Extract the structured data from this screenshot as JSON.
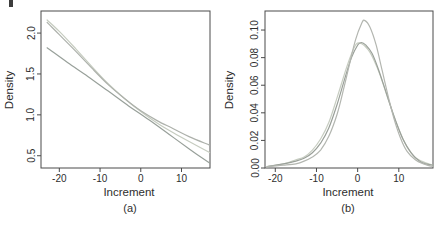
{
  "figure": {
    "ylabel": "Density",
    "xlabel": "Increment",
    "panel_captions": [
      "(a)",
      "(b)"
    ]
  },
  "chart_data": [
    {
      "type": "line",
      "panel": "a",
      "caption": "(a)",
      "title": "",
      "xlabel": "Increment",
      "ylabel": "Density",
      "grid": false,
      "legend": null,
      "xlim": [
        -24.5,
        17
      ],
      "ylim": [
        0.35,
        2.27
      ],
      "xticks": {
        "values": [
          -20,
          -10,
          0,
          10
        ],
        "labels": [
          "-20",
          "-10",
          "0",
          "10"
        ]
      },
      "yticks": {
        "values": [
          0.5,
          1.0,
          1.5,
          2.0
        ],
        "labels": [
          "0.5",
          "1.0",
          "1.5",
          "2.0"
        ]
      },
      "series": [
        {
          "name": "curve-light",
          "color": "#c6ccc0",
          "points": [
            [
              -23,
              2.16
            ],
            [
              -20,
              2.02
            ],
            [
              -16,
              1.81
            ],
            [
              -12,
              1.59
            ],
            [
              -8,
              1.38
            ],
            [
              -4,
              1.2
            ],
            [
              0,
              1.04
            ],
            [
              4,
              0.9
            ],
            [
              8,
              0.78
            ],
            [
              12,
              0.67
            ],
            [
              16.9,
              0.54
            ]
          ]
        },
        {
          "name": "curve-gray",
          "color": "#adb1ab",
          "points": [
            [
              -23,
              2.13
            ],
            [
              -20,
              1.98
            ],
            [
              -16,
              1.78
            ],
            [
              -12,
              1.57
            ],
            [
              -8,
              1.37
            ],
            [
              -4,
              1.2
            ],
            [
              0,
              1.05
            ],
            [
              4,
              0.93
            ],
            [
              8,
              0.83
            ],
            [
              12,
              0.73
            ],
            [
              16.9,
              0.63
            ]
          ]
        },
        {
          "name": "straight-line",
          "color": "#98a09a",
          "points": [
            [
              -23,
              1.82
            ],
            [
              -18,
              1.64
            ],
            [
              -13,
              1.47
            ],
            [
              -8,
              1.29
            ],
            [
              -3,
              1.11
            ],
            [
              2,
              0.94
            ],
            [
              7,
              0.76
            ],
            [
              12,
              0.58
            ],
            [
              16.9,
              0.41
            ]
          ]
        }
      ]
    },
    {
      "type": "line",
      "panel": "b",
      "caption": "(b)",
      "title": "",
      "xlabel": "Increment",
      "ylabel": "Density",
      "grid": false,
      "legend": null,
      "xlim": [
        -22.5,
        18.3
      ],
      "ylim": [
        0,
        0.1138
      ],
      "xticks": {
        "values": [
          -20,
          -10,
          0,
          10
        ],
        "labels": [
          "-20",
          "-10",
          "0",
          "10"
        ]
      },
      "yticks": {
        "values": [
          0.0,
          0.02,
          0.04,
          0.06,
          0.08,
          0.1
        ],
        "labels": [
          "0.00",
          "0.02",
          "0.04",
          "0.06",
          "0.08",
          "0.10"
        ]
      },
      "series": [
        {
          "name": "broad-curve-light",
          "color": "#c7cdc1",
          "points": [
            [
              -22,
              0.001
            ],
            [
              -18,
              0.003
            ],
            [
              -15,
              0.006
            ],
            [
              -13,
              0.008
            ],
            [
              -11,
              0.013
            ],
            [
              -9,
              0.021
            ],
            [
              -7,
              0.033
            ],
            [
              -5,
              0.051
            ],
            [
              -3,
              0.07
            ],
            [
              -1.6,
              0.082
            ],
            [
              -0.3,
              0.09
            ],
            [
              1,
              0.09
            ],
            [
              2.5,
              0.086
            ],
            [
              4,
              0.078
            ],
            [
              5.5,
              0.067
            ],
            [
              7.5,
              0.049
            ],
            [
              9.5,
              0.032
            ],
            [
              11.5,
              0.018
            ],
            [
              13.5,
              0.009
            ],
            [
              15.5,
              0.005
            ],
            [
              18.3,
              0.002
            ]
          ]
        },
        {
          "name": "broad-curve-dark",
          "color": "#9aa099",
          "points": [
            [
              -22,
              0.001
            ],
            [
              -18,
              0.003
            ],
            [
              -15,
              0.005
            ],
            [
              -13,
              0.007
            ],
            [
              -11,
              0.011
            ],
            [
              -9,
              0.018
            ],
            [
              -7,
              0.029
            ],
            [
              -5,
              0.046
            ],
            [
              -3,
              0.066
            ],
            [
              -1.5,
              0.08
            ],
            [
              0,
              0.089
            ],
            [
              0.9,
              0.091
            ],
            [
              2,
              0.089
            ],
            [
              3.5,
              0.083
            ],
            [
              5,
              0.072
            ],
            [
              7,
              0.054
            ],
            [
              9,
              0.036
            ],
            [
              11,
              0.021
            ],
            [
              13,
              0.011
            ],
            [
              15,
              0.005
            ],
            [
              16.5,
              0.003
            ],
            [
              18.3,
              0.002
            ]
          ]
        },
        {
          "name": "narrow-tall-curve",
          "color": "#b3b6b0",
          "points": [
            [
              -22,
              0.001
            ],
            [
              -18,
              0.002
            ],
            [
              -15,
              0.003
            ],
            [
              -13,
              0.005
            ],
            [
              -11,
              0.008
            ],
            [
              -9,
              0.013
            ],
            [
              -7,
              0.023
            ],
            [
              -5,
              0.039
            ],
            [
              -3.5,
              0.056
            ],
            [
              -2,
              0.075
            ],
            [
              -0.5,
              0.093
            ],
            [
              1,
              0.105
            ],
            [
              1.7,
              0.107
            ],
            [
              3,
              0.102
            ],
            [
              4.5,
              0.089
            ],
            [
              6,
              0.07
            ],
            [
              7.5,
              0.051
            ],
            [
              9,
              0.034
            ],
            [
              10.5,
              0.021
            ],
            [
              12,
              0.012
            ],
            [
              14,
              0.006
            ],
            [
              16,
              0.003
            ],
            [
              18.3,
              0.001
            ]
          ]
        }
      ]
    }
  ]
}
